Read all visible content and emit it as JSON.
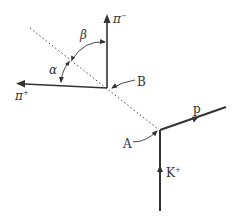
{
  "diagram": {
    "type": "particle-decay-tracks",
    "colors": {
      "track": "#333333",
      "dotted": "#444444",
      "background": "#ffffff"
    },
    "vertices": {
      "A": {
        "label": "A",
        "x": 160,
        "y": 130
      },
      "B": {
        "label": "B",
        "x": 107,
        "y": 88
      }
    },
    "tracks": [
      {
        "id": "K+",
        "label": "K",
        "sup": "+",
        "from": "bottom",
        "to": "A"
      },
      {
        "id": "p",
        "label": "p",
        "from": "A",
        "to": "upper-right"
      },
      {
        "id": "pi-",
        "label": "π",
        "sup": "−",
        "from": "B",
        "to": "up"
      },
      {
        "id": "pi+",
        "label": "π",
        "sup": "+",
        "from": "B",
        "to": "left"
      }
    ],
    "angles": [
      {
        "label": "α",
        "between": [
          "pi+",
          "neutral-line"
        ]
      },
      {
        "label": "β",
        "between": [
          "neutral-line",
          "pi-"
        ]
      }
    ],
    "neutral_line": {
      "style": "dotted",
      "from": "A",
      "through": "B"
    }
  }
}
